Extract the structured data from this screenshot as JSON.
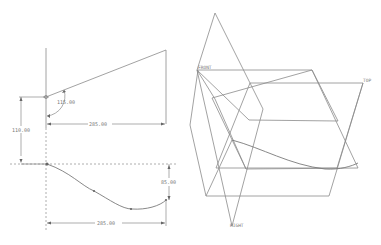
{
  "views": {
    "top_sketch": {
      "angle_dim": "115.00",
      "horizontal_dim": "285.00",
      "vertical_dim": "110.00"
    },
    "bottom_sketch": {
      "vertical_dim": "85.00",
      "horizontal_dim": "285.00"
    },
    "datum_planes": {
      "front_label": "FRONT",
      "top_label": "TOP",
      "right_label": "RIGHT"
    }
  },
  "colors": {
    "line": "#8a8a8a",
    "text": "#777777",
    "background": "#ffffff"
  }
}
